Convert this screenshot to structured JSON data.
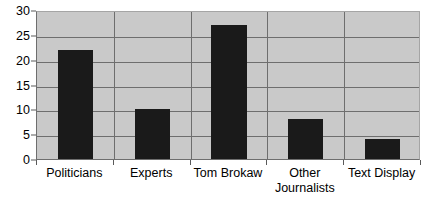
{
  "chart_data": {
    "type": "bar",
    "title": "",
    "subtitle": "",
    "xlabel": "",
    "ylabel": "",
    "categories": [
      "Politicians",
      "Experts",
      "Tom Brokaw",
      "Other Journalists",
      "Text Display"
    ],
    "category_lines": [
      [
        "Politicians"
      ],
      [
        "Experts"
      ],
      [
        "Tom Brokaw"
      ],
      [
        "Other",
        "Journalists"
      ],
      [
        "Text Display"
      ]
    ],
    "values": [
      22,
      10,
      27,
      8,
      4
    ],
    "ylim": [
      0,
      30
    ],
    "ytick_values": [
      0,
      5,
      10,
      15,
      20,
      25,
      30
    ],
    "ytick_labels": [
      "0",
      "5",
      "10",
      "15",
      "20",
      "25",
      "30"
    ],
    "grid": {
      "horizontal": true,
      "vertical": true,
      "color": "#6e6e6e"
    },
    "legend": {
      "visible": false,
      "position": "none",
      "entries": []
    },
    "colors": {
      "bar": "#1a1a1a",
      "plot_background": "#c9c9c9",
      "figure_background": "#ffffff",
      "axis": "#5a5a5a",
      "text": "#000000"
    }
  }
}
